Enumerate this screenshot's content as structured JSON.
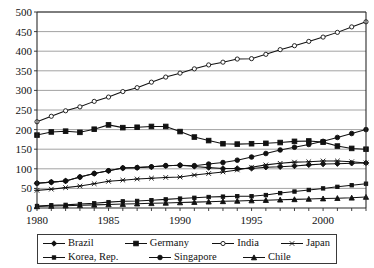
{
  "chart_data": {
    "type": "line",
    "title": "",
    "xlabel": "",
    "ylabel": "",
    "xlim": [
      1980,
      2003
    ],
    "ylim": [
      0,
      500
    ],
    "y_ticks": [
      0,
      50,
      100,
      150,
      200,
      250,
      300,
      350,
      400,
      450,
      500
    ],
    "x_ticks": [
      1980,
      1985,
      1990,
      1995,
      2000
    ],
    "x_tick_labels": [
      "1980",
      "1985",
      "1990",
      "1995",
      "2000"
    ],
    "grid": "horizontal",
    "legend_position": "below",
    "x": [
      1980,
      1981,
      1982,
      1983,
      1984,
      1985,
      1986,
      1987,
      1988,
      1989,
      1990,
      1991,
      1992,
      1993,
      1994,
      1995,
      1996,
      1997,
      1998,
      1999,
      2000,
      2001,
      2002,
      2003
    ],
    "series": [
      {
        "name": "Brazil",
        "marker": "diamond",
        "values": [
          63,
          66,
          69,
          79,
          88,
          95,
          102,
          103,
          105,
          108,
          109,
          106,
          103,
          101,
          101,
          101,
          104,
          105,
          107,
          110,
          112,
          113,
          114,
          115
        ]
      },
      {
        "name": "Germany",
        "marker": "square-filled",
        "values": [
          186,
          194,
          196,
          193,
          201,
          212,
          205,
          206,
          208,
          208,
          195,
          181,
          172,
          164,
          163,
          164,
          165,
          167,
          170,
          171,
          168,
          158,
          152,
          150
        ]
      },
      {
        "name": "India",
        "marker": "circle-open",
        "values": [
          220,
          234,
          248,
          258,
          272,
          283,
          297,
          307,
          321,
          334,
          344,
          355,
          365,
          372,
          380,
          381,
          392,
          404,
          414,
          425,
          436,
          448,
          462,
          475
        ]
      },
      {
        "name": "Japan",
        "marker": "x",
        "values": [
          45,
          48,
          52,
          56,
          62,
          68,
          71,
          74,
          76,
          78,
          79,
          84,
          88,
          92,
          97,
          104,
          110,
          114,
          117,
          118,
          120,
          120,
          118,
          115
        ]
      },
      {
        "name": "Korea, Rep.",
        "marker": "square-small",
        "values": [
          5,
          7,
          8,
          10,
          12,
          15,
          17,
          18,
          20,
          22,
          24,
          26,
          28,
          29,
          30,
          30,
          33,
          38,
          42,
          46,
          50,
          54,
          58,
          62
        ]
      },
      {
        "name": "Singapore",
        "marker": "circle-filled",
        "values": [
          63,
          66,
          69,
          79,
          88,
          95,
          102,
          103,
          105,
          108,
          109,
          108,
          112,
          116,
          122,
          130,
          139,
          148,
          155,
          162,
          170,
          180,
          190,
          200
        ]
      },
      {
        "name": "Chile",
        "marker": "triangle",
        "values": [
          4,
          5,
          6,
          7,
          8,
          9,
          10,
          11,
          12,
          13,
          14,
          15,
          16,
          17,
          18,
          19,
          20,
          21,
          22,
          23,
          24,
          25,
          26,
          28
        ]
      }
    ]
  },
  "legend": {
    "items": [
      {
        "label": "Brazil",
        "marker": "diamond"
      },
      {
        "label": "Germany",
        "marker": "square-filled"
      },
      {
        "label": "India",
        "marker": "circle-open"
      },
      {
        "label": "Japan",
        "marker": "x"
      },
      {
        "label": "Korea, Rep.",
        "marker": "square-small"
      },
      {
        "label": "Singapore",
        "marker": "circle-filled"
      },
      {
        "label": "Chile",
        "marker": "triangle"
      }
    ]
  }
}
